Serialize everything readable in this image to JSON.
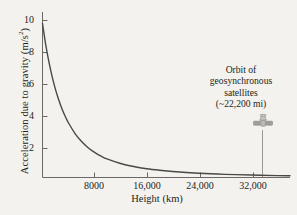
{
  "chart_data": {
    "type": "line",
    "title": "",
    "xlabel": "Height (km)",
    "ylabel": "Acceleration due to gravity (m/s²)",
    "ylabel_text": "Acceleration due to gravity (m/s",
    "ylabel_sup": "2",
    "ylabel_tail": ")",
    "xlim": [
      0,
      38000
    ],
    "ylim": [
      0,
      11
    ],
    "xticks": [
      8000,
      16000,
      24000,
      32000
    ],
    "xtick_labels": [
      "8000",
      "16,000",
      "24,000",
      "32,000"
    ],
    "yticks": [
      2,
      4,
      6,
      8,
      10
    ],
    "ytick_labels": [
      "2",
      "4",
      "6",
      "8",
      "10"
    ],
    "grid": false,
    "legend": null,
    "series": [
      {
        "name": "Acceleration due to gravity",
        "color": "#4a4845",
        "x": [
          0,
          500,
          1000,
          1500,
          2000,
          2500,
          3000,
          3500,
          4000,
          5000,
          6000,
          7000,
          8000,
          9000,
          10000,
          12000,
          14000,
          16000,
          18000,
          20000,
          24000,
          28000,
          32000,
          36000,
          38000
        ],
        "y": [
          9.81,
          8.45,
          7.33,
          6.39,
          5.6,
          4.94,
          4.37,
          3.89,
          3.47,
          2.8,
          2.29,
          1.9,
          1.6,
          1.36,
          1.17,
          0.89,
          0.7,
          0.56,
          0.46,
          0.38,
          0.27,
          0.2,
          0.16,
          0.12,
          0.11
        ]
      }
    ],
    "annotations": [
      {
        "name": "geosynchronous-orbit-callout",
        "lines": [
          "Orbit of",
          "geosynchronous",
          "satellites",
          "(~22,200 mi)"
        ],
        "pointer_x": 35800,
        "icon": "satellite-icon"
      }
    ]
  },
  "colors": {
    "background": "#f4f2ee",
    "axis": "#6b6865",
    "curve": "#4a4845",
    "text": "#221f1d",
    "leader_line": "#8e8b87"
  }
}
